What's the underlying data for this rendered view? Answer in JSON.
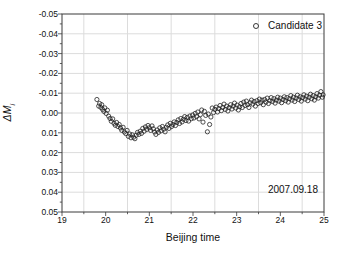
{
  "figure": {
    "xlabel": "Beijing time",
    "ylabel_main": "ΔM",
    "ylabel_sub": "i",
    "legend_label": "Candidate 3",
    "annotation": "2007.09.18"
  },
  "chart_data": {
    "type": "scatter",
    "title": "",
    "xlabel": "Beijing time",
    "ylabel": "ΔM_i",
    "legend": {
      "label": "Candidate 3",
      "position": "top-right-inside",
      "marker": "open-circle"
    },
    "annotation": {
      "text": "2007.09.18",
      "position": "bottom-right-inside"
    },
    "xlim": [
      19,
      25
    ],
    "ylim": [
      -0.05,
      0.05
    ],
    "y_axis_reversed": true,
    "grid": true,
    "x_ticks": [
      19,
      20,
      21,
      22,
      23,
      24,
      25
    ],
    "x_tick_labels": [
      "19",
      "20",
      "21",
      "22",
      "23",
      "24",
      "25"
    ],
    "y_ticks": [
      -0.05,
      -0.04,
      -0.03,
      -0.02,
      -0.01,
      0.0,
      0.01,
      0.02,
      0.03,
      0.04,
      0.05
    ],
    "y_tick_labels": [
      "-0.05",
      "-0.04",
      "-0.03",
      "-0.02",
      "-0.01",
      "0.00",
      "0.01",
      "0.02",
      "0.03",
      "0.04",
      "0.05"
    ],
    "x_minor_step": 0.5,
    "y_minor_step": 0.005,
    "x_gridlines": [
      19.5,
      20.5,
      21.5,
      22.5,
      23.5,
      24.5
    ],
    "y_gridlines": [
      -0.04,
      -0.03,
      -0.02,
      -0.01,
      0.0,
      0.01,
      0.02,
      0.03,
      0.04
    ],
    "colors": {
      "marker": "#222222",
      "grid": "#dcdcdc",
      "frame": "#3a3a3a",
      "text": "#111111",
      "background": "#ffffff"
    },
    "points": [
      [
        19.8,
        -0.0068
      ],
      [
        19.84,
        -0.0035
      ],
      [
        19.86,
        -0.0048
      ],
      [
        19.89,
        -0.0028
      ],
      [
        19.91,
        -0.0042
      ],
      [
        19.93,
        -0.0018
      ],
      [
        19.96,
        -0.0008
      ],
      [
        19.98,
        -0.0026
      ],
      [
        20.01,
        0.0002
      ],
      [
        20.04,
        -0.0014
      ],
      [
        20.07,
        0.0016
      ],
      [
        20.1,
        0.0028
      ],
      [
        20.13,
        0.0042
      ],
      [
        20.16,
        0.003
      ],
      [
        20.19,
        0.0052
      ],
      [
        20.22,
        0.0062
      ],
      [
        20.25,
        0.0048
      ],
      [
        20.28,
        0.0068
      ],
      [
        20.31,
        0.0058
      ],
      [
        20.34,
        0.0076
      ],
      [
        20.37,
        0.0088
      ],
      [
        20.4,
        0.0072
      ],
      [
        20.43,
        0.0096
      ],
      [
        20.46,
        0.0104
      ],
      [
        20.49,
        0.0088
      ],
      [
        20.52,
        0.0118
      ],
      [
        20.55,
        0.0106
      ],
      [
        20.58,
        0.0125
      ],
      [
        20.61,
        0.011
      ],
      [
        20.64,
        0.0122
      ],
      [
        20.67,
        0.013
      ],
      [
        20.7,
        0.0112
      ],
      [
        20.73,
        0.0098
      ],
      [
        20.76,
        0.0108
      ],
      [
        20.79,
        0.0092
      ],
      [
        20.82,
        0.0103
      ],
      [
        20.85,
        0.0078
      ],
      [
        20.88,
        0.0092
      ],
      [
        20.91,
        0.007
      ],
      [
        20.94,
        0.0083
      ],
      [
        20.97,
        0.0063
      ],
      [
        21.0,
        0.0075
      ],
      [
        21.03,
        0.0088
      ],
      [
        21.06,
        0.0065
      ],
      [
        21.09,
        0.008
      ],
      [
        21.12,
        0.0096
      ],
      [
        21.15,
        0.0108
      ],
      [
        21.18,
        0.0086
      ],
      [
        21.21,
        0.0098
      ],
      [
        21.24,
        0.0075
      ],
      [
        21.27,
        0.009
      ],
      [
        21.3,
        0.0068
      ],
      [
        21.33,
        0.0082
      ],
      [
        21.36,
        0.0095
      ],
      [
        21.39,
        0.0072
      ],
      [
        21.42,
        0.006
      ],
      [
        21.45,
        0.0078
      ],
      [
        21.48,
        0.0052
      ],
      [
        21.51,
        0.0068
      ],
      [
        21.54,
        0.0058
      ],
      [
        21.57,
        0.0045
      ],
      [
        21.6,
        0.0063
      ],
      [
        21.63,
        0.0048
      ],
      [
        21.66,
        0.0035
      ],
      [
        21.69,
        0.0053
      ],
      [
        21.72,
        0.0028
      ],
      [
        21.75,
        0.0045
      ],
      [
        21.78,
        0.0032
      ],
      [
        21.81,
        0.0018
      ],
      [
        21.84,
        0.0038
      ],
      [
        21.87,
        0.0022
      ],
      [
        21.9,
        0.0041
      ],
      [
        21.93,
        0.0015
      ],
      [
        21.96,
        0.0029
      ],
      [
        21.99,
        0.001
      ],
      [
        22.02,
        0.0025
      ],
      [
        22.05,
        0.0002
      ],
      [
        22.08,
        0.0018
      ],
      [
        22.11,
        -0.0005
      ],
      [
        22.14,
        0.003
      ],
      [
        22.17,
        0.0008
      ],
      [
        22.2,
        -0.0015
      ],
      [
        22.23,
        0.0046
      ],
      [
        22.26,
        -0.0008
      ],
      [
        22.29,
        0.0012
      ],
      [
        22.33,
        0.0095
      ],
      [
        22.35,
        0.0005
      ],
      [
        22.38,
        0.0058
      ],
      [
        22.41,
        0.002
      ],
      [
        22.44,
        -0.0025
      ],
      [
        22.47,
        -0.0002
      ],
      [
        22.5,
        -0.0018
      ],
      [
        22.53,
        -0.003
      ],
      [
        22.56,
        -0.0005
      ],
      [
        22.59,
        -0.0022
      ],
      [
        22.62,
        -0.0038
      ],
      [
        22.65,
        -0.0012
      ],
      [
        22.68,
        -0.0028
      ],
      [
        22.71,
        -0.0045
      ],
      [
        22.74,
        -0.0018
      ],
      [
        22.77,
        -0.0035
      ],
      [
        22.8,
        -0.001
      ],
      [
        22.83,
        -0.0028
      ],
      [
        22.86,
        -0.0042
      ],
      [
        22.89,
        -0.002
      ],
      [
        22.92,
        -0.0035
      ],
      [
        22.95,
        -0.005
      ],
      [
        22.98,
        -0.0025
      ],
      [
        23.01,
        -0.004
      ],
      [
        23.04,
        -0.0015
      ],
      [
        23.07,
        -0.0032
      ],
      [
        23.1,
        -0.0048
      ],
      [
        23.13,
        -0.0028
      ],
      [
        23.16,
        -0.0055
      ],
      [
        23.19,
        -0.0038
      ],
      [
        23.22,
        -0.006
      ],
      [
        23.25,
        -0.0042
      ],
      [
        23.28,
        -0.0028
      ],
      [
        23.31,
        -0.0052
      ],
      [
        23.34,
        -0.0065
      ],
      [
        23.37,
        -0.0045
      ],
      [
        23.4,
        -0.0058
      ],
      [
        23.43,
        -0.0035
      ],
      [
        23.46,
        -0.0062
      ],
      [
        23.49,
        -0.0048
      ],
      [
        23.52,
        -0.007
      ],
      [
        23.55,
        -0.0052
      ],
      [
        23.58,
        -0.0065
      ],
      [
        23.61,
        -0.0042
      ],
      [
        23.64,
        -0.0068
      ],
      [
        23.67,
        -0.0055
      ],
      [
        23.7,
        -0.0075
      ],
      [
        23.73,
        -0.0048
      ],
      [
        23.76,
        -0.0062
      ],
      [
        23.79,
        -0.0078
      ],
      [
        23.82,
        -0.0058
      ],
      [
        23.85,
        -0.0072
      ],
      [
        23.88,
        -0.005
      ],
      [
        23.91,
        -0.0065
      ],
      [
        23.94,
        -0.008
      ],
      [
        23.97,
        -0.006
      ],
      [
        24.0,
        -0.0075
      ],
      [
        24.03,
        -0.0052
      ],
      [
        24.06,
        -0.0068
      ],
      [
        24.09,
        -0.0082
      ],
      [
        24.12,
        -0.0062
      ],
      [
        24.15,
        -0.0078
      ],
      [
        24.18,
        -0.0055
      ],
      [
        24.21,
        -0.0072
      ],
      [
        24.24,
        -0.0088
      ],
      [
        24.27,
        -0.0065
      ],
      [
        24.3,
        -0.008
      ],
      [
        24.33,
        -0.0058
      ],
      [
        24.36,
        -0.0075
      ],
      [
        24.39,
        -0.009
      ],
      [
        24.42,
        -0.0068
      ],
      [
        24.45,
        -0.0082
      ],
      [
        24.48,
        -0.006
      ],
      [
        24.51,
        -0.0078
      ],
      [
        24.54,
        -0.0092
      ],
      [
        24.57,
        -0.007
      ],
      [
        24.6,
        -0.0085
      ],
      [
        24.63,
        -0.0062
      ],
      [
        24.66,
        -0.008
      ],
      [
        24.69,
        -0.0095
      ],
      [
        24.72,
        -0.0072
      ],
      [
        24.75,
        -0.0088
      ],
      [
        24.78,
        -0.0065
      ],
      [
        24.81,
        -0.0082
      ],
      [
        24.84,
        -0.0098
      ],
      [
        24.87,
        -0.0075
      ],
      [
        24.9,
        -0.009
      ],
      [
        24.93,
        -0.0108
      ],
      [
        24.96,
        -0.008
      ],
      [
        24.98,
        -0.0092
      ]
    ]
  }
}
